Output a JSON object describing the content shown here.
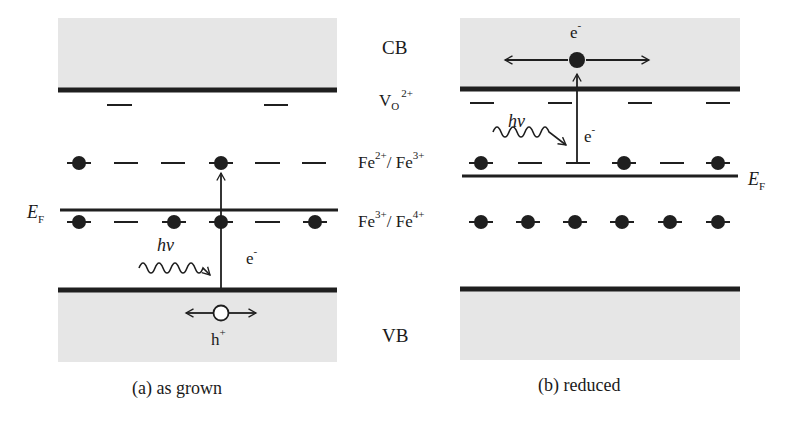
{
  "figure": {
    "center_labels": {
      "cb": "CB",
      "vo_base": "V",
      "vo_sub": "O",
      "vo_sup": "2+",
      "fe23_a": "Fe",
      "fe23_a_sup": "2+",
      "fe23_sep": "/ Fe",
      "fe23_b_sup": "3+",
      "fe34_a": "Fe",
      "fe34_a_sup": "3+",
      "fe34_sep": "/ Fe",
      "fe34_b_sup": "4+",
      "vb": "VB"
    },
    "panel_a": {
      "caption": "(a) as grown",
      "fermi_label_base": "E",
      "fermi_label_sub": "F",
      "photon_label": "hν",
      "electron_label": "e",
      "electron_sup": "-",
      "hole_label": "h",
      "hole_sup": "+"
    },
    "panel_b": {
      "caption": "(b) reduced",
      "fermi_label_base": "E",
      "fermi_label_sub": "F",
      "photon_label": "hν",
      "electron_label": "e",
      "electron_sup": "-",
      "cb_electron_label": "e",
      "cb_electron_sup": "-"
    },
    "colors": {
      "band_shade": "#e6e6e6",
      "line": "#1f1f1f",
      "background": "#ffffff"
    }
  }
}
